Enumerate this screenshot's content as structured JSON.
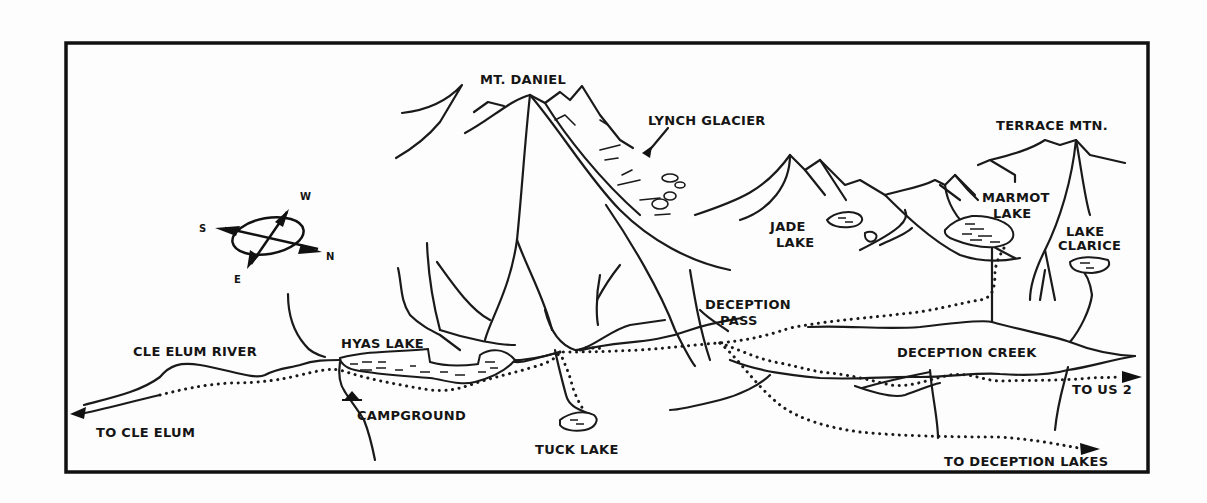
{
  "map": {
    "title": "",
    "colors": {
      "ink": "#1a1a1a",
      "paper": "#fdfdfd"
    },
    "compass": {
      "labels": {
        "west": "W",
        "south": "S",
        "north": "N",
        "east": "E"
      }
    },
    "peaks": {
      "mt_daniel": "MT. DANIEL",
      "terrace_mtn": "TERRACE MTN."
    },
    "features": {
      "lynch_glacier": "LYNCH GLACIER",
      "deception_pass_line1": "DECEPTION",
      "deception_pass_line2": "PASS",
      "campground": "CAMPGROUND"
    },
    "lakes": {
      "jade_line1": "JADE",
      "jade_line2": "LAKE",
      "marmot_line1": "MARMOT",
      "marmot_line2": "LAKE",
      "clarice_line1": "LAKE",
      "clarice_line2": "CLARICE",
      "hyas": "HYAS LAKE",
      "tuck": "TUCK LAKE"
    },
    "waterways": {
      "cle_elum_river": "CLE ELUM RIVER",
      "deception_creek": "DECEPTION CREEK"
    },
    "directions": {
      "to_cle_elum": "TO CLE ELUM",
      "to_us2": "TO US 2",
      "to_deception_lakes": "TO DECEPTION LAKES"
    }
  }
}
